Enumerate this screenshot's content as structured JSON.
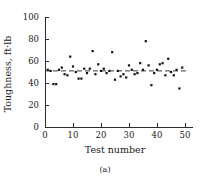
{
  "figure": {
    "caption": "(a)"
  },
  "chart_data": {
    "type": "scatter",
    "title": "",
    "xlabel": "Test number",
    "ylabel": "Toughness, ft·lb",
    "xlim": [
      0,
      52
    ],
    "ylim": [
      0,
      100
    ],
    "xticks": [
      0,
      10,
      20,
      30,
      40,
      50
    ],
    "xticklabels": [
      "0",
      "10",
      "20",
      "30",
      "40",
      "50"
    ],
    "yticks": [
      0,
      20,
      40,
      60,
      80,
      100
    ],
    "yticklabels": [
      "0",
      "20",
      "40",
      "60",
      "80",
      "100"
    ],
    "grid": false,
    "legend": null,
    "marker": "filled-square",
    "mean_line": {
      "value": 51,
      "style": "dashed",
      "label": ""
    },
    "x": [
      1,
      2,
      3,
      4,
      5,
      6,
      7,
      8,
      9,
      10,
      11,
      12,
      13,
      14,
      15,
      16,
      17,
      18,
      19,
      20,
      21,
      22,
      23,
      24,
      25,
      26,
      27,
      28,
      29,
      30,
      31,
      32,
      33,
      34,
      35,
      36,
      37,
      38,
      39,
      40,
      41,
      42,
      43,
      44,
      45,
      46,
      47,
      48,
      49
    ],
    "values": [
      52,
      51,
      39,
      39,
      52,
      54,
      48,
      47,
      64,
      55,
      50,
      44,
      44,
      53,
      49,
      53,
      69,
      48,
      57,
      51,
      53,
      49,
      51,
      68,
      43,
      51,
      46,
      48,
      45,
      56,
      52,
      48,
      49,
      58,
      52,
      78,
      56,
      38,
      49,
      52,
      57,
      58,
      47,
      62,
      50,
      47,
      52,
      35,
      54
    ],
    "series": [
      {
        "name": "Toughness",
        "values": [
          52,
          51,
          39,
          39,
          52,
          54,
          48,
          47,
          64,
          55,
          50,
          44,
          44,
          53,
          49,
          53,
          69,
          48,
          57,
          51,
          53,
          49,
          51,
          68,
          43,
          51,
          46,
          48,
          45,
          56,
          52,
          48,
          49,
          58,
          52,
          78,
          56,
          38,
          49,
          52,
          57,
          58,
          47,
          62,
          50,
          47,
          52,
          35,
          54
        ]
      }
    ]
  }
}
